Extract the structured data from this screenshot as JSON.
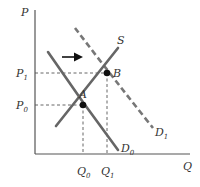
{
  "diagram": {
    "axes": {
      "y_label": "P",
      "x_label": "Q"
    },
    "price_labels": [
      {
        "text": "P",
        "sub": "1"
      },
      {
        "text": "P",
        "sub": "0"
      }
    ],
    "quantity_labels": [
      {
        "text": "Q",
        "sub": "0"
      },
      {
        "text": "Q",
        "sub": "1"
      }
    ],
    "curves": {
      "supply": {
        "label": "S"
      },
      "demand_initial": {
        "label": "D",
        "sub": "0"
      },
      "demand_shifted": {
        "label": "D",
        "sub": "1",
        "style": "dashed"
      }
    },
    "points": [
      {
        "label": "A",
        "meaning": "initial equilibrium (Q0, P0)"
      },
      {
        "label": "B",
        "meaning": "new equilibrium (Q1, P1)"
      }
    ],
    "shift_arrow": {
      "direction": "right"
    }
  }
}
